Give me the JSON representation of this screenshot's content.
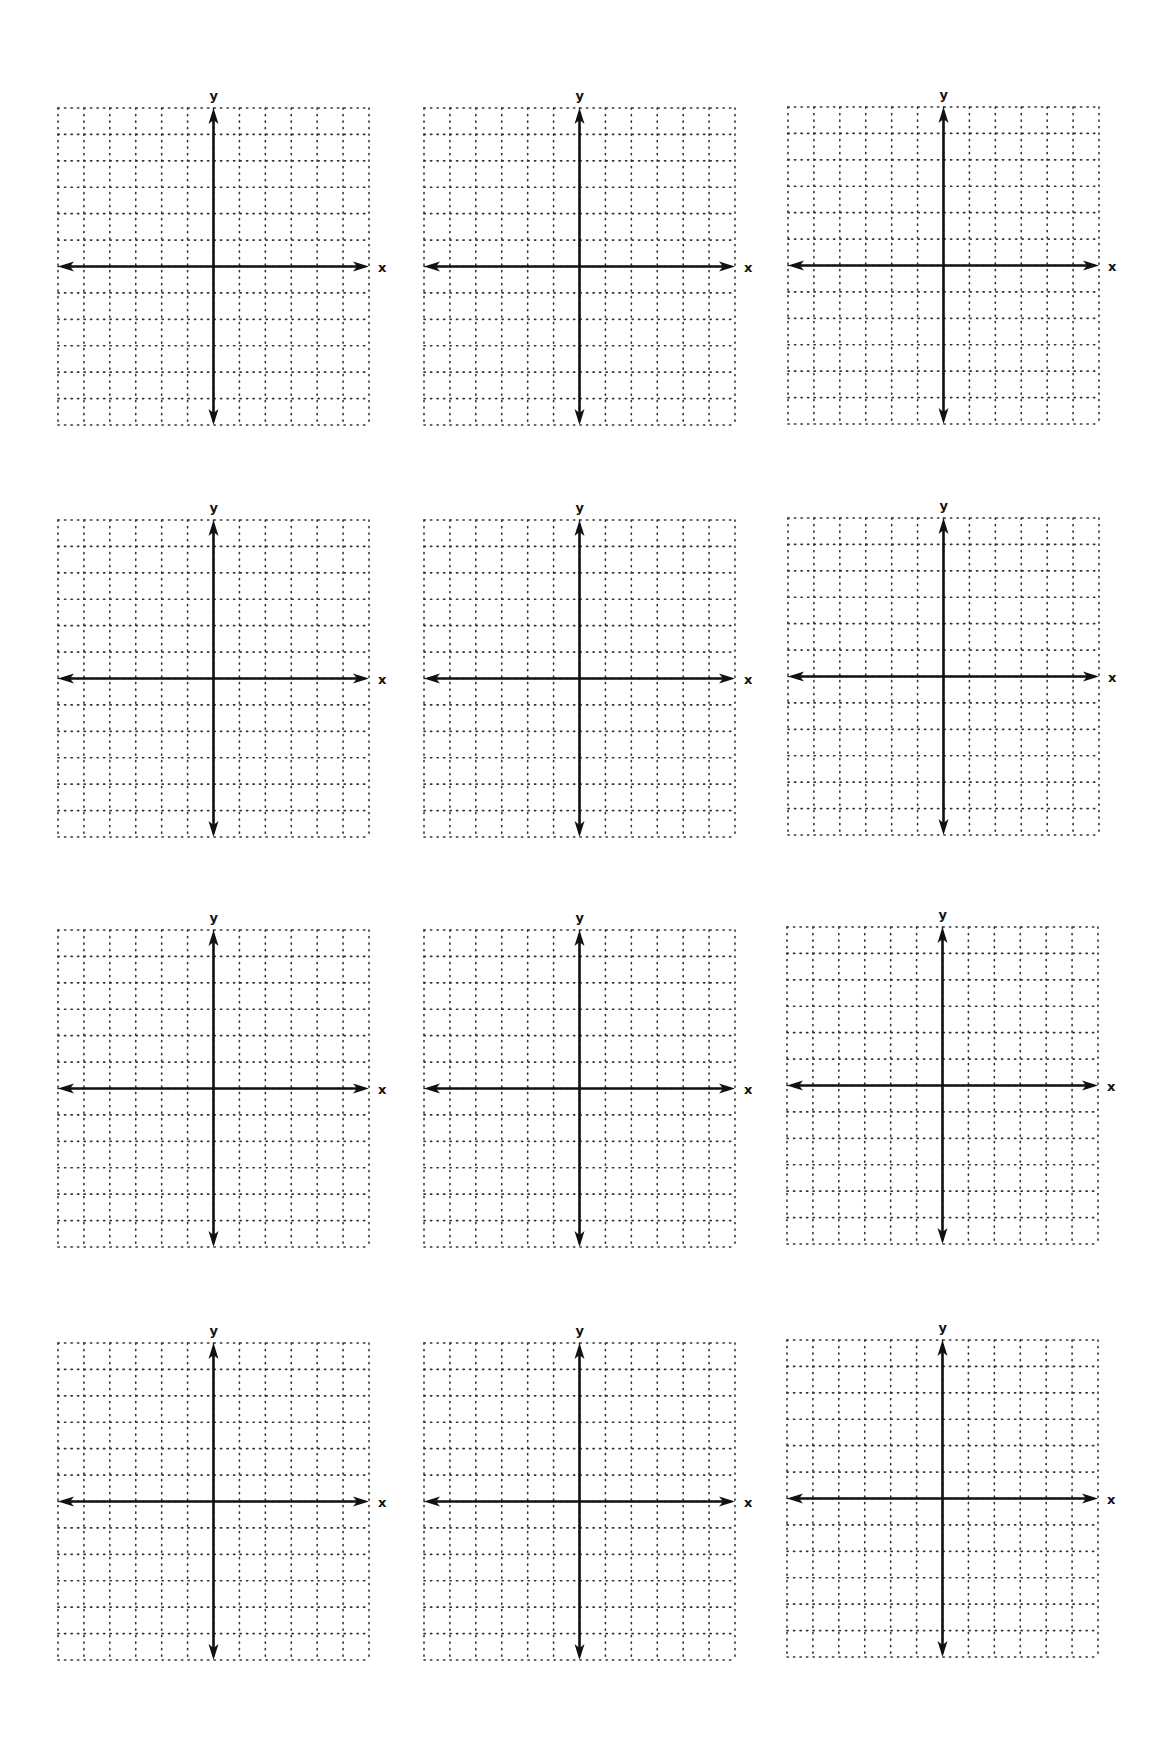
{
  "page": {
    "background": "#ffffff",
    "ink_color": "#111111"
  },
  "grid_spec": {
    "columns": 12,
    "rows": 12,
    "axis_column": 6,
    "axis_row": 6,
    "line_style": "dotted",
    "x_label": "x",
    "y_label": "y"
  },
  "planes": [
    {
      "id": "plane-1",
      "row": 1,
      "col": 1,
      "left": 58,
      "top": 108,
      "x_label": "x",
      "y_label": "y"
    },
    {
      "id": "plane-2",
      "row": 1,
      "col": 2,
      "left": 424,
      "top": 108,
      "x_label": "x",
      "y_label": "y"
    },
    {
      "id": "plane-3",
      "row": 1,
      "col": 3,
      "left": 788,
      "top": 107,
      "x_label": "x",
      "y_label": "y"
    },
    {
      "id": "plane-4",
      "row": 2,
      "col": 1,
      "left": 58,
      "top": 520,
      "x_label": "x",
      "y_label": "y"
    },
    {
      "id": "plane-5",
      "row": 2,
      "col": 2,
      "left": 424,
      "top": 520,
      "x_label": "x",
      "y_label": "y"
    },
    {
      "id": "plane-6",
      "row": 2,
      "col": 3,
      "left": 788,
      "top": 518,
      "x_label": "x",
      "y_label": "y"
    },
    {
      "id": "plane-7",
      "row": 3,
      "col": 1,
      "left": 58,
      "top": 930,
      "x_label": "x",
      "y_label": "y"
    },
    {
      "id": "plane-8",
      "row": 3,
      "col": 2,
      "left": 424,
      "top": 930,
      "x_label": "x",
      "y_label": "y"
    },
    {
      "id": "plane-9",
      "row": 3,
      "col": 3,
      "left": 787,
      "top": 927,
      "x_label": "x",
      "y_label": "y"
    },
    {
      "id": "plane-10",
      "row": 4,
      "col": 1,
      "left": 58,
      "top": 1343,
      "x_label": "x",
      "y_label": "y"
    },
    {
      "id": "plane-11",
      "row": 4,
      "col": 2,
      "left": 424,
      "top": 1343,
      "x_label": "x",
      "y_label": "y"
    },
    {
      "id": "plane-12",
      "row": 4,
      "col": 3,
      "left": 787,
      "top": 1340,
      "x_label": "x",
      "y_label": "y"
    }
  ]
}
